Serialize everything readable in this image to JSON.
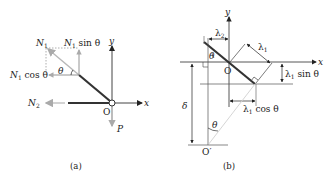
{
  "figure_a": {
    "caption": "(a)",
    "labels": {
      "N1": "N",
      "N1_sub": "1",
      "N1_sin": "N",
      "N1_sin_sub": "1",
      "N1_sin_rest": " sin θ",
      "N1_cos": "N",
      "N1_cos_sub": "1",
      "N1_cos_rest": " cos θ",
      "theta": "θ",
      "N2": "N",
      "N2_sub": "2",
      "origin": "O",
      "x_axis": "x",
      "y_axis": "y",
      "P": "P"
    }
  },
  "figure_b": {
    "caption": "(b)",
    "labels": {
      "lambda2": "λ",
      "lambda2_sub": "2",
      "lambda1": "λ",
      "lambda1_sub": "1",
      "theta_top": "θ",
      "origin": "O",
      "x_axis": "x",
      "y_axis": "y",
      "lambda1_sin": "λ",
      "lambda1_sin_sub": "1",
      "lambda1_sin_rest": " sin θ",
      "lambda1_cos": "λ",
      "lambda1_cos_sub": "1",
      "lambda1_cos_rest": " cos θ",
      "delta": "δ",
      "theta_bottom": "θ",
      "origin_prime": "O′"
    }
  },
  "colors": {
    "line": "#222222",
    "gray": "#9a9a9a",
    "light": "#c8c8c8",
    "rod": "#333333"
  }
}
